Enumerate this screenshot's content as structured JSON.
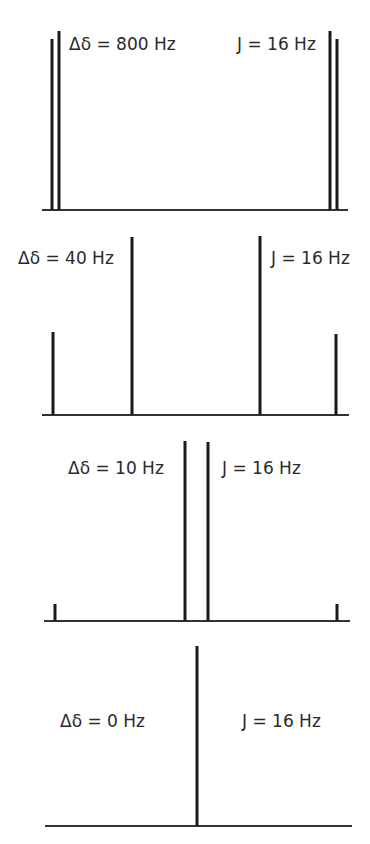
{
  "diagram": {
    "panels": [
      {
        "id": "panel-800",
        "shift_label": "Δδ = 800 Hz",
        "coupling_label": "J = 16 Hz",
        "baseline": {
          "x1": 42,
          "x2": 348,
          "y": 210
        },
        "shift_label_pos": {
          "x": 69,
          "y": 50
        },
        "coupling_label_pos": {
          "x": 237,
          "y": 50
        },
        "peaks": [
          {
            "x": 52,
            "top": 39
          },
          {
            "x": 59,
            "top": 31
          },
          {
            "x": 330,
            "top": 31
          },
          {
            "x": 337,
            "top": 39
          }
        ]
      },
      {
        "id": "panel-40",
        "shift_label": "Δδ = 40 Hz",
        "coupling_label": "J = 16 Hz",
        "baseline": {
          "x1": 42,
          "x2": 349,
          "y": 415
        },
        "shift_label_pos": {
          "x": 18,
          "y": 264
        },
        "coupling_label_pos": {
          "x": 271,
          "y": 264
        },
        "peaks": [
          {
            "x": 53,
            "top": 332
          },
          {
            "x": 132,
            "top": 237
          },
          {
            "x": 260,
            "top": 236
          },
          {
            "x": 336,
            "top": 334
          }
        ]
      },
      {
        "id": "panel-10",
        "shift_label": "Δδ = 10 Hz",
        "coupling_label": "J = 16 Hz",
        "baseline": {
          "x1": 44,
          "x2": 350,
          "y": 621
        },
        "shift_label_pos": {
          "x": 68,
          "y": 474
        },
        "coupling_label_pos": {
          "x": 222,
          "y": 474
        },
        "peaks": [
          {
            "x": 55,
            "top": 604
          },
          {
            "x": 185,
            "top": 441
          },
          {
            "x": 208,
            "top": 442
          },
          {
            "x": 337,
            "top": 604
          }
        ]
      },
      {
        "id": "panel-0",
        "shift_label": "Δδ = 0 Hz",
        "coupling_label": "J = 16 Hz",
        "baseline": {
          "x1": 45,
          "x2": 352,
          "y": 826
        },
        "shift_label_pos": {
          "x": 60,
          "y": 727
        },
        "coupling_label_pos": {
          "x": 242,
          "y": 727
        },
        "peaks": [
          {
            "x": 197,
            "top": 646
          }
        ]
      }
    ]
  }
}
